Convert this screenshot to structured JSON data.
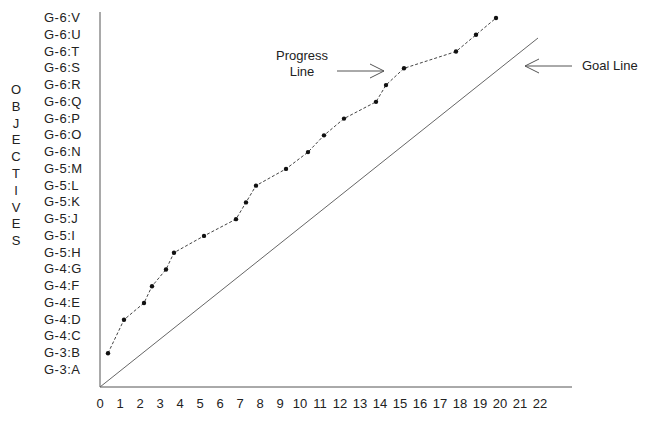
{
  "chart_data": {
    "type": "line",
    "title": "",
    "xlabel": "",
    "ylabel": "OBJECTIVES",
    "xlim": [
      0,
      22
    ],
    "x_ticks": [
      "0",
      "1",
      "2",
      "3",
      "4",
      "5",
      "6",
      "7",
      "8",
      "9",
      "10",
      "11",
      "12",
      "13",
      "14",
      "15",
      "16",
      "17",
      "18",
      "19",
      "20",
      "21",
      "22"
    ],
    "y_ticks": [
      "G-3:A",
      "G-3:B",
      "G-4:C",
      "G-4:D",
      "G-4:E",
      "G-4:F",
      "G-4:G",
      "G-5:H",
      "G-5:I",
      "G-5:J",
      "G-5:K",
      "G-5:L",
      "G-5:M",
      "G-6:N",
      "G-6:O",
      "G-6:P",
      "G-6:Q",
      "G-6:R",
      "G-6:S",
      "G-6:T",
      "G-6:U",
      "G-6:V"
    ],
    "grid": false,
    "legend": "none",
    "series": [
      {
        "name": "Progress Line",
        "style": "dashed with dot markers",
        "x": [
          0.4,
          1.2,
          2.2,
          2.6,
          3.3,
          3.7,
          5.2,
          6.8,
          7.3,
          7.8,
          9.3,
          10.4,
          11.2,
          12.2,
          13.8,
          14.3,
          15.2,
          17.8,
          18.8,
          19.8
        ],
        "y": [
          "G-3:B",
          "G-4:D",
          "G-4:E",
          "G-4:F",
          "G-4:G",
          "G-5:H",
          "G-5:I",
          "G-5:J",
          "G-5:K",
          "G-5:L",
          "G-5:M",
          "G-6:N",
          "G-6:O",
          "G-6:P",
          "G-6:Q",
          "G-6:R",
          "G-6:S",
          "G-6:T",
          "G-6:U",
          "G-6:V"
        ],
        "y_index": [
          1,
          3,
          4,
          5,
          6,
          7,
          8,
          9,
          10,
          11,
          12,
          13,
          14,
          15,
          16,
          17,
          18,
          19,
          20,
          21
        ]
      },
      {
        "name": "Goal Line",
        "style": "solid",
        "x": [
          0,
          21.9
        ],
        "y_index": [
          -1,
          19.9
        ]
      }
    ],
    "annotations": [
      {
        "text": "Progress Line",
        "arrow_to": "progress line near x=15"
      },
      {
        "text": "Goal Line",
        "arrow_to": "goal line end near x=22"
      }
    ]
  },
  "labels": {
    "y_axis_title_letters": [
      "O",
      "B",
      "J",
      "E",
      "C",
      "T",
      "I",
      "V",
      "E",
      "S"
    ],
    "progress_annotation_line1": "Progress",
    "progress_annotation_line2": "Line",
    "goal_annotation": "Goal Line"
  }
}
